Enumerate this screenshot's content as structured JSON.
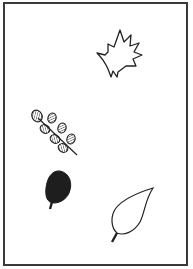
{
  "figure": {
    "leaves": [
      {
        "id": "maple",
        "label": "maple-leaf",
        "style": "outline"
      },
      {
        "id": "compound",
        "label": "compound-leaf",
        "style": "hatched"
      },
      {
        "id": "oval",
        "label": "oval-leaf",
        "style": "filled"
      },
      {
        "id": "pointed",
        "label": "pointed-leaf",
        "style": "outline"
      }
    ],
    "colors": {
      "ink": "#222222",
      "frame": "#3a3a3a",
      "paper": "#ffffff"
    }
  }
}
